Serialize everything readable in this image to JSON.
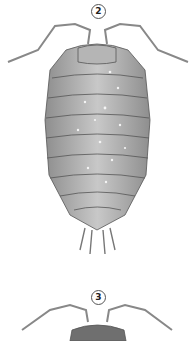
{
  "figure": {
    "specimens": [
      {
        "label": "2",
        "subject": "woodlouse (isopod), dorsal view, grey with pale speckles"
      },
      {
        "label": "3",
        "subject": "woodlouse (isopod), dorsal view, dark granulated head (partially visible)"
      }
    ],
    "colors": {
      "background": "#ffffff",
      "body": "#a9a9a9",
      "outline": "#555555",
      "speckle": "#f2f2f2"
    }
  }
}
